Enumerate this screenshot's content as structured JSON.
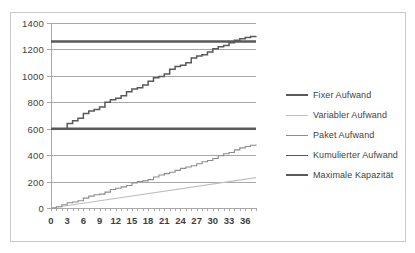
{
  "chart_data": {
    "type": "line",
    "title": "",
    "xlabel": "",
    "ylabel": "",
    "xlim": [
      0,
      38
    ],
    "ylim": [
      0,
      1400
    ],
    "yticks": [
      0,
      200,
      400,
      600,
      800,
      1000,
      1200,
      1400
    ],
    "xticks": [
      0,
      3,
      6,
      9,
      12,
      15,
      18,
      21,
      24,
      27,
      30,
      33,
      36
    ],
    "xtick_step_minor": 1,
    "grid": true,
    "legend_position": "right",
    "series": [
      {
        "name": "Fixer Aufwand",
        "color": "#595959",
        "width": 2.6,
        "shape": "constant",
        "x": [
          0,
          38
        ],
        "values": [
          600,
          600
        ]
      },
      {
        "name": "Variabler Aufwand",
        "color": "#bfbfbf",
        "width": 1.1,
        "shape": "linear",
        "x": [
          0,
          38
        ],
        "values": [
          0,
          230
        ]
      },
      {
        "name": "Paket Aufwand",
        "color": "#8c8c8c",
        "width": 1.1,
        "shape": "step",
        "x": [
          0,
          1,
          2,
          3,
          4,
          5,
          6,
          7,
          8,
          9,
          10,
          11,
          12,
          13,
          14,
          15,
          16,
          17,
          18,
          19,
          20,
          21,
          22,
          23,
          24,
          25,
          26,
          27,
          28,
          29,
          30,
          31,
          32,
          33,
          34,
          35,
          36,
          37,
          38
        ],
        "values": [
          0,
          10,
          25,
          40,
          45,
          55,
          75,
          90,
          100,
          105,
          120,
          140,
          150,
          160,
          170,
          190,
          200,
          205,
          215,
          235,
          250,
          260,
          270,
          285,
          300,
          310,
          320,
          335,
          350,
          360,
          375,
          395,
          410,
          420,
          440,
          455,
          465,
          475,
          480
        ]
      },
      {
        "name": "Kumulierter Aufwand",
        "color": "#595959",
        "width": 1.5,
        "shape": "step",
        "x": [
          0,
          1,
          2,
          3,
          4,
          5,
          6,
          7,
          8,
          9,
          10,
          11,
          12,
          13,
          14,
          15,
          16,
          17,
          18,
          19,
          20,
          21,
          22,
          23,
          24,
          25,
          26,
          27,
          28,
          29,
          30,
          31,
          32,
          33,
          34,
          35,
          36,
          37,
          38
        ],
        "values": [
          600,
          600,
          600,
          640,
          660,
          680,
          715,
          735,
          745,
          765,
          800,
          820,
          830,
          850,
          880,
          900,
          910,
          930,
          960,
          985,
          995,
          1015,
          1050,
          1070,
          1080,
          1100,
          1135,
          1150,
          1160,
          1180,
          1205,
          1220,
          1230,
          1250,
          1270,
          1280,
          1290,
          1298,
          1300
        ]
      },
      {
        "name": "Maximale Kapazität",
        "color": "#595959",
        "width": 2.6,
        "shape": "constant",
        "x": [
          0,
          38
        ],
        "values": [
          1260,
          1260
        ]
      }
    ]
  },
  "legend": {
    "items": [
      {
        "label": "Fixer Aufwand"
      },
      {
        "label": "Variabler Aufwand"
      },
      {
        "label": "Paket Aufwand"
      },
      {
        "label": "Kumulierter Aufwand"
      },
      {
        "label": "Maximale Kapazität"
      }
    ]
  },
  "colors": {
    "dark": "#595959",
    "medium": "#8c8c8c",
    "light": "#bfbfbf",
    "grid": "#a8a8a8",
    "border": "#c9c9c9",
    "text": "#3f3f3f"
  }
}
